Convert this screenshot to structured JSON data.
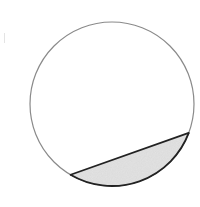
{
  "diagram": {
    "type": "circle-segment",
    "circle": {
      "cx": 112,
      "cy": 104,
      "r": 82,
      "stroke": "#8a8a8a",
      "stroke_width": 1.2,
      "fill": "#ffffff"
    },
    "chord": {
      "x1": 71,
      "y1": 174,
      "x2": 189,
      "y2": 133,
      "stroke": "#222222",
      "stroke_width": 1.8
    },
    "segment": {
      "fill": "#e4e4e4",
      "stroke": "#222222",
      "stroke_width": 1.8,
      "shaded": true
    }
  },
  "colors": {
    "background": "#ffffff",
    "circle_outline": "#8a8a8a",
    "bold_outline": "#222222",
    "shade": "#e4e4e4"
  }
}
